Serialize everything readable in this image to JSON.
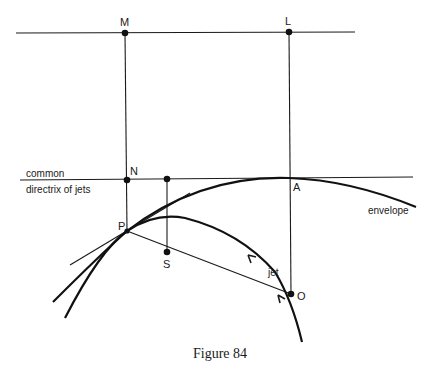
{
  "figure": {
    "caption": "Figure 84",
    "labels": {
      "M": "M",
      "L": "L",
      "N": "N",
      "A": "A",
      "P": "P",
      "S": "S",
      "O": "O",
      "directrix_line1": "common",
      "directrix_line2": "directrix  of jets",
      "envelope": "envelope",
      "jet": "jet"
    },
    "colors": {
      "ink": "#111111",
      "background": "#ffffff"
    }
  }
}
